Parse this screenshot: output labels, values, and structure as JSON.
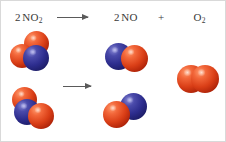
{
  "figure": {
    "caption": "Balanced chemical equation with space-filling molecular models",
    "reaction": "2 NO2 -> 2 NO + O2"
  },
  "equation": {
    "reactant": {
      "coefficient": "2",
      "formula": "NO",
      "subscript": "2"
    },
    "arrow": "⟶",
    "product1": {
      "coefficient": "2",
      "formula": "NO",
      "subscript": ""
    },
    "plus": "+",
    "product2": {
      "coefficient": "",
      "formula": "O",
      "subscript": "2"
    }
  },
  "colors": {
    "oxygen": "#da3f17",
    "nitrogen": "#2d2d8e",
    "arrow": "#5a5a5a",
    "text": "#3a3a3a",
    "background": "#ffffff",
    "border": "#d9d9d9"
  },
  "legend": {
    "oxygen_label": "O",
    "nitrogen_label": "N"
  },
  "models": {
    "reactants": [
      {
        "name": "nitrogen-dioxide-model-1",
        "formula": "NO2",
        "atoms": [
          "O",
          "N",
          "O"
        ]
      },
      {
        "name": "nitrogen-dioxide-model-2",
        "formula": "NO2",
        "atoms": [
          "O",
          "N",
          "O"
        ]
      }
    ],
    "products": [
      {
        "name": "nitric-oxide-model-1",
        "formula": "NO",
        "atoms": [
          "N",
          "O"
        ]
      },
      {
        "name": "nitric-oxide-model-2",
        "formula": "NO",
        "atoms": [
          "O",
          "N"
        ]
      },
      {
        "name": "dioxygen-model",
        "formula": "O2",
        "atoms": [
          "O",
          "O"
        ]
      }
    ]
  }
}
